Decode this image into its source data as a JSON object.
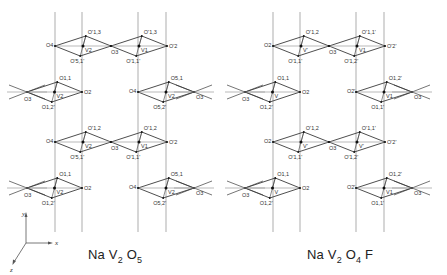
{
  "figure": {
    "panels": [
      {
        "id": "left",
        "caption": {
          "parts": [
            "Na ",
            "V",
            "2",
            " O",
            "5"
          ],
          "text": "NaV2O5"
        },
        "rows": [
          {
            "y": 46,
            "labels": {
              "outer_left": "O4",
              "top1": "O'1,3",
              "bottom1": "O'5,1'",
              "center1": "V2",
              "mid": "O3",
              "top2": "O'1,3",
              "bottom2": "O'1,1'",
              "center2": "V1",
              "outer_right": "O'2"
            }
          },
          {
            "y": 92,
            "left_group": {
              "apex_left": "O3",
              "top": "O1,1",
              "bottom": "O1,2'",
              "center": "V2",
              "apex_right": "O2"
            },
            "right_group": {
              "apex_left": "O4",
              "top": "O5,1",
              "bottom": "O5,2'",
              "center": "V2",
              "apex_right": "O3"
            }
          },
          {
            "y": 142,
            "labels": {
              "outer_left": "O4",
              "top1": "O'1,2",
              "bottom1": "O'5,1'",
              "center1": "V2",
              "mid": "O3",
              "top2": "O'1,2",
              "bottom2": "O'1,1'",
              "center2": "V1",
              "outer_right": "O'2"
            }
          },
          {
            "y": 188,
            "left_group": {
              "apex_left": "O3",
              "top": "O1,1",
              "bottom": "O1,2'",
              "center": "V2",
              "apex_right": "O2"
            },
            "right_group": {
              "apex_left": "O4",
              "top": "O5,1",
              "bottom": "O5,2'",
              "center": "V2",
              "apex_right": "O3"
            }
          }
        ]
      },
      {
        "id": "right",
        "caption": {
          "parts": [
            "Na ",
            "V",
            "2",
            " O",
            "4",
            " F"
          ],
          "text": "NaV2O4F"
        },
        "rows": [
          {
            "y": 46,
            "labels": {
              "outer_left": "O2",
              "top1": "O'1,2",
              "bottom1": "O'1,1'",
              "center1": "V'",
              "mid": "O3",
              "top2": "O'1,1'",
              "bottom2": "O'1,2'",
              "center2": "V1",
              "outer_right": "O'2'"
            }
          },
          {
            "y": 92,
            "left_group": {
              "apex_left": "O3",
              "top": "O1,1",
              "bottom": "O1,2'",
              "center": "V",
              "apex_right": "O2"
            },
            "right_group": {
              "apex_left": "O2'",
              "top": "O1,2'",
              "bottom": "O1,1'",
              "center": "V1",
              "apex_right": "O3"
            }
          },
          {
            "y": 142,
            "labels": {
              "outer_left": "O2",
              "top1": "O'1,2",
              "bottom1": "O'1,1'",
              "center1": "V'",
              "mid": "O3",
              "top2": "O'1,1'",
              "bottom2": "O'1,2'",
              "center2": "V'",
              "outer_right": "O'2'"
            }
          },
          {
            "y": 188,
            "left_group": {
              "apex_left": "O3",
              "top": "O1,1",
              "bottom": "O1,2'",
              "center": "V",
              "apex_right": "O2"
            },
            "right_group": {
              "apex_left": "O2'",
              "top": "O1,2'",
              "bottom": "O1,1'",
              "center": "V1",
              "apex_right": "O3"
            }
          }
        ]
      }
    ],
    "axes": {
      "x_label": "x",
      "y_label": "y",
      "z_label": "z"
    },
    "colors": {
      "line": "#3a3a3a",
      "grid_line": "#8a8a8a",
      "dot": "#111111",
      "background": "#ffffff"
    }
  }
}
